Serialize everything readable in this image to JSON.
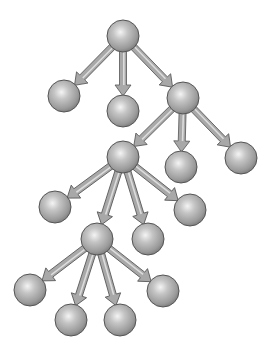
{
  "diagram": {
    "type": "tree",
    "colors": {
      "background": "#ffffff",
      "node_fill_light": "#e8e8e8",
      "node_fill_mid": "#b4b4b4",
      "node_fill_dark": "#7a7a7a",
      "node_stroke": "#555555",
      "arrow_light": "#c8c8c8",
      "arrow_dark": "#6e6e6e",
      "arrow_stroke": "#555555"
    },
    "node_radius": 16,
    "nodes": [
      {
        "id": "root",
        "x": 123,
        "y": 36
      },
      {
        "id": "n1",
        "x": 64,
        "y": 96
      },
      {
        "id": "n2",
        "x": 123,
        "y": 111
      },
      {
        "id": "n3",
        "x": 183,
        "y": 98
      },
      {
        "id": "n4",
        "x": 123,
        "y": 157
      },
      {
        "id": "n5",
        "x": 181,
        "y": 167
      },
      {
        "id": "n6",
        "x": 241,
        "y": 158
      },
      {
        "id": "n7",
        "x": 55,
        "y": 207
      },
      {
        "id": "n8",
        "x": 97,
        "y": 239
      },
      {
        "id": "n9",
        "x": 148,
        "y": 239
      },
      {
        "id": "n10",
        "x": 190,
        "y": 210
      },
      {
        "id": "n11",
        "x": 30,
        "y": 290
      },
      {
        "id": "n12",
        "x": 71,
        "y": 320
      },
      {
        "id": "n13",
        "x": 120,
        "y": 320
      },
      {
        "id": "n14",
        "x": 163,
        "y": 291
      }
    ],
    "edges": [
      {
        "from": "root",
        "to": "n1"
      },
      {
        "from": "root",
        "to": "n2"
      },
      {
        "from": "root",
        "to": "n3"
      },
      {
        "from": "n3",
        "to": "n4"
      },
      {
        "from": "n3",
        "to": "n5"
      },
      {
        "from": "n3",
        "to": "n6"
      },
      {
        "from": "n4",
        "to": "n7"
      },
      {
        "from": "n4",
        "to": "n8"
      },
      {
        "from": "n4",
        "to": "n9"
      },
      {
        "from": "n4",
        "to": "n10"
      },
      {
        "from": "n8",
        "to": "n11"
      },
      {
        "from": "n8",
        "to": "n12"
      },
      {
        "from": "n8",
        "to": "n13"
      },
      {
        "from": "n8",
        "to": "n14"
      }
    ]
  }
}
